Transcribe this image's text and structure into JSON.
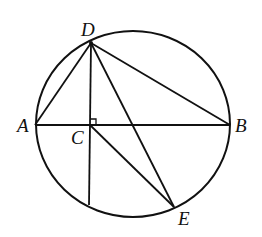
{
  "diagram": {
    "type": "geometry",
    "stroke_color": "#111111",
    "background": "#ffffff",
    "circle": {
      "cx": 133,
      "cy": 124,
      "rx": 97,
      "ry": 93
    },
    "points": {
      "A": {
        "x": 35,
        "y": 125,
        "label": "A",
        "lx": 17,
        "ly": 132
      },
      "B": {
        "x": 230,
        "y": 125,
        "label": "B",
        "lx": 235,
        "ly": 132
      },
      "C": {
        "x": 90,
        "y": 125,
        "label": "C",
        "lx": 71,
        "ly": 144
      },
      "D": {
        "x": 91,
        "y": 43,
        "label": "D",
        "lx": 81,
        "ly": 36
      },
      "E": {
        "x": 174,
        "y": 207,
        "label": "E",
        "lx": 178,
        "ly": 225
      },
      "F": {
        "x": 89,
        "y": 205,
        "label": ""
      }
    },
    "segments": [
      [
        "A",
        "B"
      ],
      [
        "D",
        "A"
      ],
      [
        "D",
        "B"
      ],
      [
        "D",
        "E"
      ],
      [
        "D",
        "F"
      ],
      [
        "C",
        "E"
      ]
    ],
    "right_angle_marker": {
      "at": "C",
      "size": 6
    }
  }
}
